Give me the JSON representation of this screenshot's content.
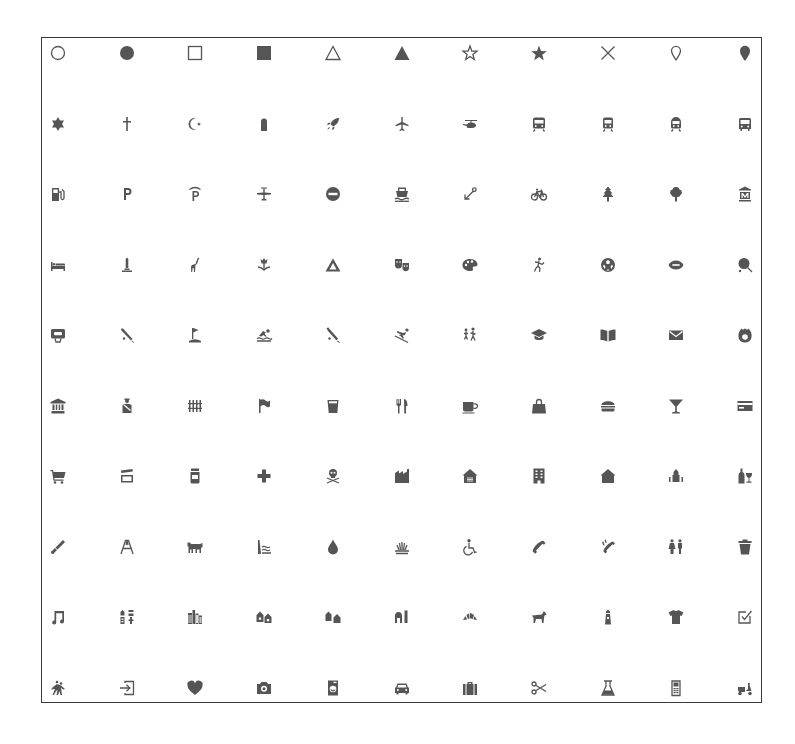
{
  "grid": {
    "columns": 11,
    "rows": 10,
    "icon_color": "#555555",
    "border_color": "#3a3a3a",
    "icons": [
      "circle-stroked",
      "circle",
      "square-stroked",
      "square",
      "triangle-stroked",
      "triangle",
      "star-stroked",
      "star",
      "cross",
      "marker-stroked",
      "marker",
      "religious-jewish",
      "religious-christian",
      "religious-muslim",
      "cemetery",
      "rocket",
      "airport",
      "heliport",
      "rail",
      "rail-metro",
      "rail-light",
      "bus",
      "fuel",
      "parking",
      "parking-garage",
      "airfield",
      "roadblock",
      "ferry",
      "harbor",
      "bicycle",
      "park",
      "park2",
      "museum",
      "lodging",
      "monument",
      "zoo",
      "garden",
      "campsite",
      "theatre",
      "art-gallery",
      "pitch",
      "soccer",
      "america-football",
      "tennis",
      "basketball",
      "baseball",
      "golf",
      "swimming",
      "cricket",
      "skiing",
      "school",
      "college",
      "library",
      "post",
      "fire-station",
      "town-hall",
      "police",
      "prison",
      "embassy",
      "beer",
      "restaurant",
      "cafe",
      "shop",
      "fast-food",
      "bar",
      "bank",
      "grocery",
      "cinema",
      "pharmacy",
      "hospital",
      "danger",
      "industrial",
      "warehouse",
      "commercial-building",
      "building",
      "place-of-worship",
      "alcohol-shop",
      "logging",
      "oil-well",
      "slaughterhouse",
      "dam",
      "water",
      "wetland",
      "disability",
      "telephone",
      "emergency-telephone",
      "toilets",
      "waste-basket",
      "music",
      "land-use",
      "city",
      "town",
      "village",
      "farm",
      "bakery",
      "dog-park",
      "lighthouse",
      "clothing-store",
      "polling-place",
      "playground",
      "entrance",
      "heart",
      "camera",
      "laundry",
      "car",
      "suitcase",
      "hairdresser",
      "chemist",
      "mobilephone",
      "scooter"
    ]
  }
}
